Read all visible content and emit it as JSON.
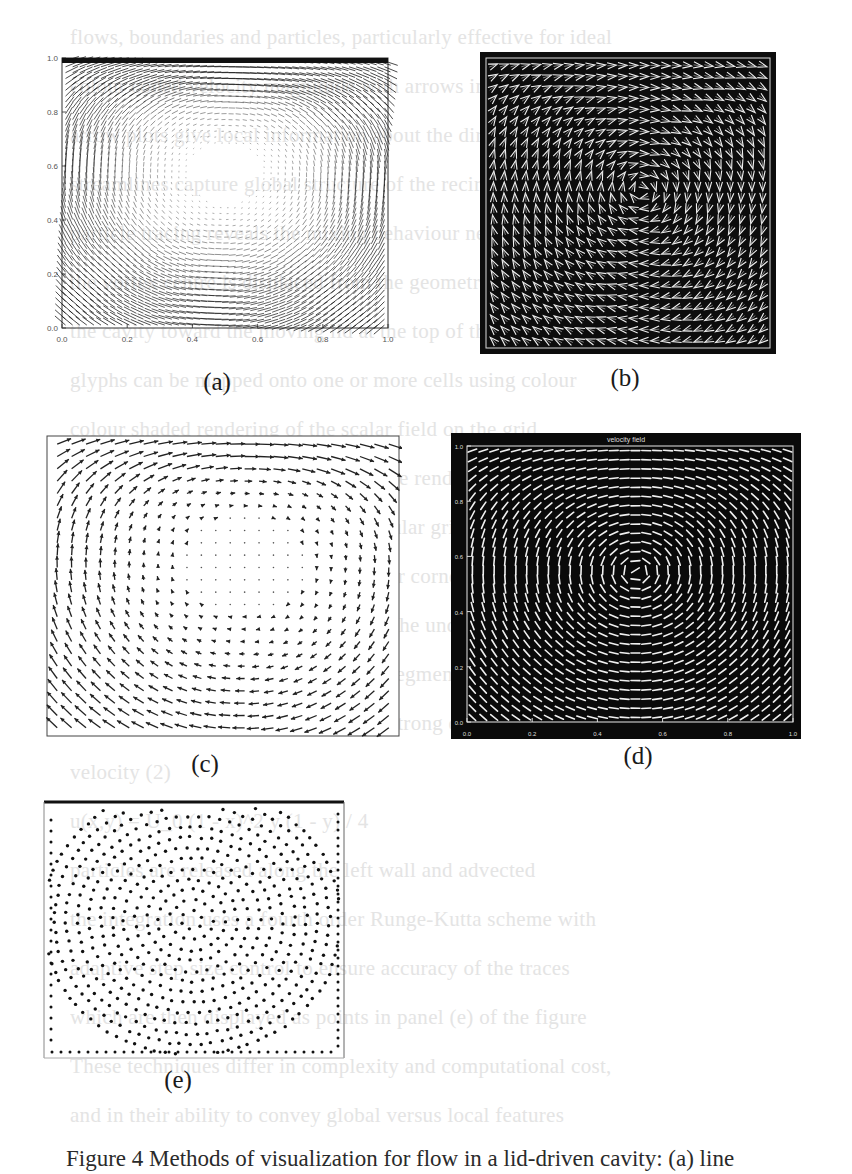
{
  "page": {
    "background_bleed_lines": [
      "flows, boundaries and particles, particularly effective for ideal",
      "colour coded velocity magnitude with arrows indicating direction",
      "arrow plots give local information about the direction of flow",
      "streamlines capture global structure of the recirculating vortex",
      "particle tracing reveals the mixing behaviour near the corners",
      "the vortex centre is displaced from the geometric centre of",
      "the cavity toward the moving lid at the top of the domain",
      "glyphs can be mapped onto one or more cells using colour",
      "colour shaded rendering of the scalar field on the grid",
      "of similar size. The remaining cells are rendered black and",
      "the velocity field is sampled on a regular grid of points",
      "secondary vortices appear in the lower corners of the box",
      "a dense field of vectors may obscure the underlying structure",
      "hedgehog display with oriented line segments at each node",
      "of the Reynolds number Re shows a strong dependence on the lid",
      "velocity (2)",
      "u(x,y) = U_0 (1 - x)^2 y (1 - y) / 4",
      "particles are released along the left wall and advected",
      "the integration uses a fourth order Runge-Kutta scheme with",
      "adaptive step size control to ensure accuracy of the traces",
      "which are then displayed as points in panel (e) of the figure",
      "These techniques differ in complexity and computational cost,",
      "and in their ability to convey global versus local features"
    ],
    "caption": "Figure 4 Methods of visualization for flow in a lid-driven cavity: (a) line"
  },
  "figure": {
    "panels": [
      {
        "id": "a",
        "label": "(a)",
        "style": "dense-line-vectors-on-white",
        "x_ticks": [
          "0.0",
          "0.2",
          "0.4",
          "0.6",
          "0.8",
          "1.0"
        ],
        "y_ticks": [
          "0.0",
          "0.2",
          "0.4",
          "0.6",
          "0.8",
          "1.0"
        ]
      },
      {
        "id": "b",
        "label": "(b)",
        "style": "white-chevron-arrows-on-black"
      },
      {
        "id": "c",
        "label": "(c)",
        "style": "arrow-glyphs-on-white"
      },
      {
        "id": "d",
        "label": "(d)",
        "style": "white-glyphs-on-black",
        "title": "velocity field",
        "x_ticks": [
          "0.0",
          "0.2",
          "0.4",
          "0.6",
          "0.8",
          "1.0"
        ],
        "y_ticks": [
          "0.0",
          "0.2",
          "0.4",
          "0.6",
          "0.8",
          "1.0"
        ]
      },
      {
        "id": "e",
        "label": "(e)",
        "style": "particle-dots-on-white"
      }
    ]
  }
}
